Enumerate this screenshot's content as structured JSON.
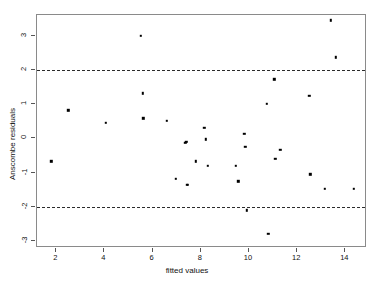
{
  "chart_data": {
    "type": "scatter",
    "title": "",
    "xlabel": "fitted values",
    "ylabel": "Anscombe residuals",
    "xlim": [
      1.2,
      14.9
    ],
    "ylim": [
      -3.2,
      3.6
    ],
    "xticks": [
      2,
      4,
      6,
      8,
      10,
      12,
      14
    ],
    "yticks": [
      3,
      2,
      1,
      0,
      -1,
      -2,
      -3
    ],
    "xtick_labels": [
      "2",
      "4",
      "6",
      "8",
      "10",
      "12",
      "14"
    ],
    "ytick_labels": [
      "3",
      "2",
      "1",
      "0",
      "-1",
      "-2",
      "-3"
    ],
    "grid": false,
    "legend": "none",
    "point_color": "#000000",
    "refline_color": "#2b2b2b",
    "panel_border_color": "#8a8a8a",
    "reference_lines": [
      {
        "name": "upper-bound",
        "y": 2,
        "style": "dashed"
      },
      {
        "name": "lower-bound",
        "y": -2,
        "style": "dashed"
      }
    ],
    "x": [
      1.8,
      2.5,
      4.05,
      5.5,
      5.6,
      5.62,
      6.6,
      6.95,
      7.35,
      7.4,
      7.42,
      7.45,
      7.8,
      8.15,
      8.2,
      8.3,
      9.45,
      9.55,
      9.8,
      9.85,
      9.9,
      10.75,
      10.8,
      11.05,
      11.1,
      11.3,
      12.5,
      12.55,
      13.15,
      13.4,
      13.6,
      14.35
    ],
    "y": [
      -0.67,
      0.82,
      0.45,
      3.0,
      1.32,
      0.58,
      0.52,
      -1.18,
      -0.13,
      -0.1,
      -1.35,
      -1.35,
      -0.67,
      0.3,
      -0.03,
      -0.8,
      -0.8,
      -1.25,
      0.13,
      -0.25,
      -2.1,
      1.0,
      -2.78,
      1.72,
      -0.6,
      -0.33,
      1.25,
      -1.05,
      -1.48,
      3.45,
      2.37,
      -1.48
    ],
    "points": [
      {
        "x": 1.8,
        "y": -0.67
      },
      {
        "x": 2.5,
        "y": 0.82
      },
      {
        "x": 4.05,
        "y": 0.45
      },
      {
        "x": 5.5,
        "y": 3.0
      },
      {
        "x": 5.6,
        "y": 1.32
      },
      {
        "x": 5.62,
        "y": 0.58
      },
      {
        "x": 6.6,
        "y": 0.52
      },
      {
        "x": 6.95,
        "y": -1.18
      },
      {
        "x": 7.35,
        "y": -0.13
      },
      {
        "x": 7.4,
        "y": -0.1
      },
      {
        "x": 7.42,
        "y": -1.35
      },
      {
        "x": 7.45,
        "y": -1.35
      },
      {
        "x": 7.8,
        "y": -0.67
      },
      {
        "x": 8.15,
        "y": 0.3
      },
      {
        "x": 8.2,
        "y": -0.03
      },
      {
        "x": 8.3,
        "y": -0.8
      },
      {
        "x": 9.45,
        "y": -0.8
      },
      {
        "x": 9.55,
        "y": -1.25
      },
      {
        "x": 9.8,
        "y": 0.13
      },
      {
        "x": 9.85,
        "y": -0.25
      },
      {
        "x": 9.9,
        "y": -2.1
      },
      {
        "x": 10.75,
        "y": 1.0
      },
      {
        "x": 10.8,
        "y": -2.78
      },
      {
        "x": 11.05,
        "y": 1.72
      },
      {
        "x": 11.1,
        "y": -0.6
      },
      {
        "x": 11.3,
        "y": -0.33
      },
      {
        "x": 12.5,
        "y": 1.25
      },
      {
        "x": 12.55,
        "y": -1.05
      },
      {
        "x": 13.15,
        "y": -1.48
      },
      {
        "x": 13.4,
        "y": 3.45
      },
      {
        "x": 13.6,
        "y": 2.37
      },
      {
        "x": 14.35,
        "y": -1.48
      }
    ]
  }
}
